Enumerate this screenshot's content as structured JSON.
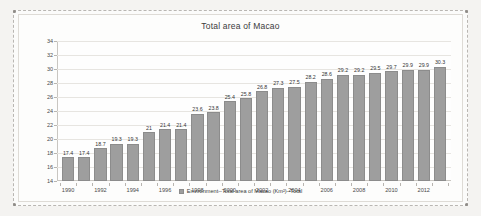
{
  "chart_data": {
    "type": "bar",
    "title": "Total area of Macao",
    "xlabel": "",
    "ylabel": "",
    "ylim": [
      14,
      34
    ],
    "yticks": [
      14,
      16,
      18,
      20,
      22,
      24,
      26,
      28,
      30,
      32,
      34
    ],
    "grid": true,
    "legend_position": "bottom",
    "legend": [
      "Environment--Total area of Macao (Km²)--Total"
    ],
    "series_color": "#9e9e9e",
    "categories": [
      "1990",
      "1991",
      "1992",
      "1993",
      "1994",
      "1995",
      "1996",
      "1997",
      "1998",
      "1999",
      "2000",
      "2001",
      "2002",
      "2003",
      "2004",
      "2005",
      "2006",
      "2007",
      "2008",
      "2009",
      "2010",
      "2011",
      "2012",
      "2013"
    ],
    "xtick_labels": [
      "1990",
      "1992",
      "1994",
      "1996",
      "1998",
      "2000",
      "2002",
      "2004",
      "2006",
      "2008",
      "2010",
      "2012"
    ],
    "values": [
      17.4,
      17.4,
      18.7,
      19.3,
      19.3,
      21,
      21.4,
      21.4,
      23.6,
      23.8,
      25.4,
      25.8,
      26.8,
      27.3,
      27.5,
      28.2,
      28.6,
      29.2,
      29.2,
      29.5,
      29.7,
      29.9,
      29.9,
      30.3
    ],
    "value_labels": [
      "17.4",
      "17.4",
      "18.7",
      "19.3",
      "19.3",
      "21",
      "21.4",
      "21.4",
      "23.6",
      "23.8",
      "25.4",
      "25.8",
      "26.8",
      "27.3",
      "27.5",
      "28.2",
      "28.6",
      "29.2",
      "29.2",
      "29.5",
      "29.7",
      "29.9",
      "29.9",
      "30.3"
    ],
    "series": [
      {
        "name": "Environment--Total area of Macao (Km²)--Total",
        "values": [
          17.4,
          17.4,
          18.7,
          19.3,
          19.3,
          21,
          21.4,
          21.4,
          23.6,
          23.8,
          25.4,
          25.8,
          26.8,
          27.3,
          27.5,
          28.2,
          28.6,
          29.2,
          29.2,
          29.5,
          29.7,
          29.9,
          29.9,
          30.3
        ]
      }
    ]
  }
}
